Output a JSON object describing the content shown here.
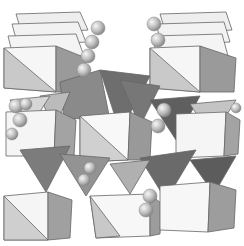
{
  "image": {
    "subject": "crystal structure polyhedral model",
    "description": "Stacked octahedra and tetrahedra with chains of spheres between layers",
    "colors": {
      "background": "#ffffff",
      "light_face": "#f2f2f2",
      "mid_face": "#bdbdbd",
      "dark_face": "#7a7a7a",
      "darker_face": "#5e5e5e",
      "edge": "#6a6a6a",
      "sphere": "#c8c8c8"
    }
  }
}
